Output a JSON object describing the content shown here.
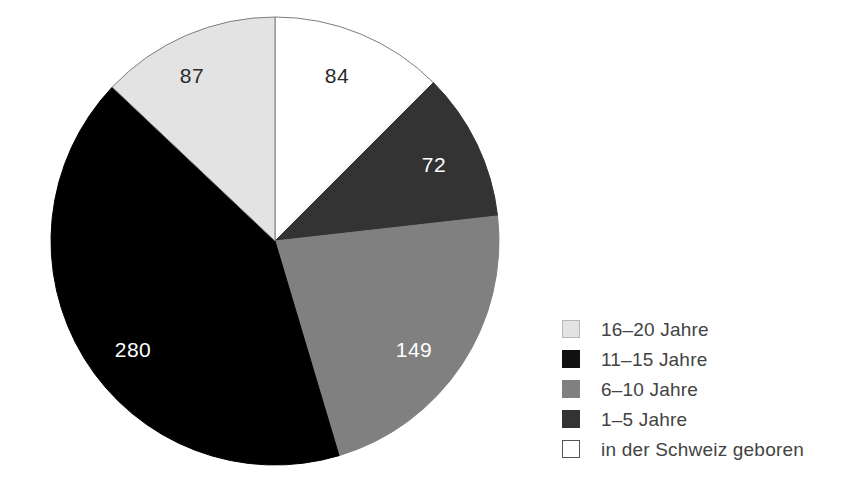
{
  "chart_data": {
    "type": "pie",
    "title": "",
    "subtitle": "",
    "xlabel": "",
    "ylabel": "",
    "total": 672,
    "categories": [
      "in der Schweiz geboren",
      "1–5 Jahre",
      "6–10 Jahre",
      "11–15 Jahre",
      "16–20 Jahre"
    ],
    "values": [
      84,
      72,
      149,
      280,
      87
    ],
    "slices": [
      {
        "label": "in der Schweiz geboren",
        "value": 84,
        "value_text": "84",
        "color": "#ffffff",
        "stroke": "#7d7d7d",
        "label_color": "#2b2b2b",
        "start_angle": 0,
        "end_angle": 45,
        "label_x": 337,
        "label_y": 83
      },
      {
        "label": "1–5 Jahre",
        "value": 72,
        "value_text": "72",
        "color": "#333333",
        "stroke": "#333333",
        "label_color": "#ffffff",
        "start_angle": 45,
        "end_angle": 83.57,
        "label_x": 434,
        "label_y": 172
      },
      {
        "label": "6–10 Jahre",
        "value": 149,
        "value_text": "149",
        "color": "#808080",
        "stroke": "#808080",
        "label_color": "#ffffff",
        "start_angle": 83.57,
        "end_angle": 163.39,
        "label_x": 414,
        "label_y": 357
      },
      {
        "label": "11–15 Jahre",
        "value": 280,
        "value_text": "280",
        "color": "#000000",
        "stroke": "#000000",
        "label_color": "#ffffff",
        "start_angle": 163.39,
        "end_angle": 313.39,
        "label_x": 133,
        "label_y": 357
      },
      {
        "label": "16–20 Jahre",
        "value": 87,
        "value_text": "87",
        "color": "#e3e3e3",
        "stroke": "#7d7d7d",
        "label_color": "#2b2b2b",
        "start_angle": 313.39,
        "end_angle": 360,
        "label_x": 192,
        "label_y": 83
      }
    ],
    "geometry": {
      "cx": 275,
      "cy": 241,
      "r": 224
    },
    "legend_position": "right",
    "legend": [
      {
        "label": "16–20 Jahre",
        "color": "#e3e3e3",
        "border": "#b8b8b8",
        "value": 87
      },
      {
        "label": "11–15 Jahre",
        "color": "#101010",
        "border": "#101010",
        "value": 280
      },
      {
        "label": "6–10 Jahre",
        "color": "#808080",
        "border": "#808080",
        "value": 149
      },
      {
        "label": "1–5 Jahre",
        "color": "#333333",
        "border": "#333333",
        "value": 72
      },
      {
        "label": "in der Schweiz geboren",
        "color": "#ffffff",
        "border": "#555555",
        "value": 84
      }
    ],
    "grid": false
  },
  "colors": {
    "background": "#ffffff",
    "text": "#434343",
    "outline": "#7d7d7d"
  }
}
